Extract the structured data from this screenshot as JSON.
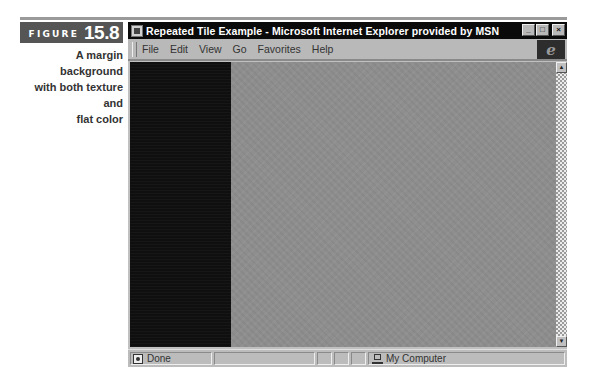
{
  "figure": {
    "word": "FIGURE",
    "number": "15.8",
    "caption_lines": [
      "A margin background",
      "with both texture and",
      "flat color"
    ]
  },
  "window": {
    "title": "Repeated Tile Example - Microsoft Internet Explorer provided by MSN",
    "controls": {
      "minimize": "_",
      "maximize": "□",
      "close": "×"
    },
    "menu": [
      {
        "label": "File",
        "accel": "F"
      },
      {
        "label": "Edit",
        "accel": "E"
      },
      {
        "label": "View",
        "accel": "V"
      },
      {
        "label": "Go",
        "accel": "G"
      },
      {
        "label": "Favorites",
        "accel": "a"
      },
      {
        "label": "Help",
        "accel": "H"
      }
    ],
    "logo": "e",
    "scrollbar": {
      "up": "▲",
      "down": "▼"
    },
    "status": {
      "text": "Done",
      "zone": "My Computer"
    }
  },
  "colors": {
    "margin": "#0f0f0f",
    "texture": "#8e8e8e",
    "figure_label_bg": "#555555"
  }
}
